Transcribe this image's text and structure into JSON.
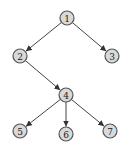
{
  "diagram": {
    "type": "tree",
    "nodes": [
      {
        "id": "1",
        "label": "1",
        "x": 67,
        "y": 18
      },
      {
        "id": "2",
        "label": "2",
        "x": 20,
        "y": 56
      },
      {
        "id": "3",
        "label": "3",
        "x": 112,
        "y": 56
      },
      {
        "id": "4",
        "label": "4",
        "x": 66,
        "y": 95
      },
      {
        "id": "5",
        "label": "5",
        "x": 20,
        "y": 131
      },
      {
        "id": "6",
        "label": "6",
        "x": 66,
        "y": 134
      },
      {
        "id": "7",
        "label": "7",
        "x": 110,
        "y": 131
      }
    ],
    "edges": [
      {
        "from": "1",
        "to": "2",
        "arrow": true
      },
      {
        "from": "1",
        "to": "3",
        "arrow": true
      },
      {
        "from": "2",
        "to": "4",
        "arrow": true
      },
      {
        "from": "4",
        "to": "5",
        "arrow": true
      },
      {
        "from": "4",
        "to": "6",
        "arrow": true
      },
      {
        "from": "4",
        "to": "7",
        "arrow": true
      }
    ],
    "node_radius": 7,
    "colors": {
      "node_fill": "#d9d9d9",
      "node_stroke": "#555555",
      "edge": "#444444"
    }
  }
}
